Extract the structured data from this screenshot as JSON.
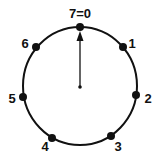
{
  "diagram": {
    "type": "modular-clock",
    "modulus": 7,
    "top_label": "7=0",
    "circle": {
      "cx": 80,
      "cy": 86,
      "rx": 57,
      "ry": 59,
      "color": "#111111"
    },
    "hand": {
      "from": [
        80,
        87
      ],
      "to": [
        80,
        34
      ],
      "points_to": "0"
    },
    "points": [
      {
        "label": "7=0",
        "dot": [
          80,
          27
        ],
        "text": [
          80,
          18
        ]
      },
      {
        "label": "1",
        "dot": [
          123,
          47
        ],
        "text": [
          132,
          48
        ]
      },
      {
        "label": "2",
        "dot": [
          136,
          95
        ],
        "text": [
          148,
          103
        ]
      },
      {
        "label": "3",
        "dot": [
          111,
          136
        ],
        "text": [
          118,
          151
        ]
      },
      {
        "label": "4",
        "dot": [
          52,
          138
        ],
        "text": [
          45,
          151
        ]
      },
      {
        "label": "5",
        "dot": [
          23,
          97
        ],
        "text": [
          12,
          103
        ]
      },
      {
        "label": "6",
        "dot": [
          36,
          47
        ],
        "text": [
          25,
          48
        ]
      }
    ]
  }
}
